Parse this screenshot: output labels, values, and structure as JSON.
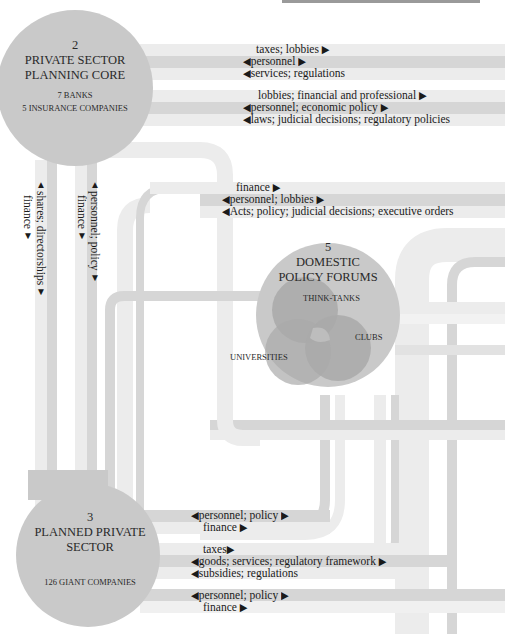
{
  "colors": {
    "band_light": "#ececec",
    "band_mid": "#d6d6d6",
    "node_fill": "#c9c9c9",
    "venn_fill": "#a9a9a9",
    "venn_overlap": "#bdbdbd",
    "text": "#1a1a1a"
  },
  "nodes": {
    "planning_core": {
      "number": "2",
      "title_line1": "PRIVATE SECTOR",
      "title_line2": "PLANNING CORE",
      "sub1": "7 BANKS",
      "sub2": "5 INSURANCE COMPANIES"
    },
    "policy_forums": {
      "number": "5",
      "title_line1": "DOMESTIC",
      "title_line2": "POLICY FORUMS",
      "venn": {
        "a": "THINK-TANKS",
        "b": "CLUBS",
        "c": "UNIVERSITIES"
      }
    },
    "planned_sector": {
      "number": "3",
      "title_line1": "PLANNED PRIVATE",
      "title_line2": "SECTOR",
      "sub1": "126 GIANT COMPANIES"
    }
  },
  "flows": {
    "core_group1": [
      "taxes; lobbies",
      "personnel",
      "services; regulations"
    ],
    "core_group2": [
      "lobbies; financial and professional",
      "personnel; economic policy",
      "laws; judicial decisions; regulatory policies"
    ],
    "forum_group": [
      "finance",
      "personnel; lobbies",
      "Acts; policy; judicial decisions; executive orders"
    ],
    "vertical_left": [
      "shares; directorships",
      "finance"
    ],
    "vertical_right": [
      "personnel; policy",
      "finance"
    ],
    "sector_group1": [
      "personnel; policy",
      "finance"
    ],
    "sector_group2": [
      "taxes",
      "goods; services; regulatory framework",
      "subsidies; regulations"
    ],
    "sector_group3": [
      "personnel; policy",
      "finance"
    ]
  },
  "arrows": {
    "right": "▶",
    "left": "◀",
    "up": "▲",
    "down": "▼"
  }
}
